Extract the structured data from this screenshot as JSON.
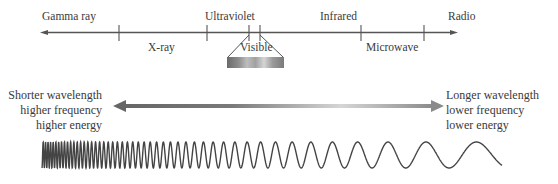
{
  "spectrum": {
    "bands_above": [
      {
        "label": "Gamma ray",
        "x": 42
      },
      {
        "label": "Ultraviolet",
        "x": 205
      },
      {
        "label": "Infrared",
        "x": 320
      },
      {
        "label": "Radio",
        "x": 448
      }
    ],
    "bands_below": [
      {
        "label": "X-ray",
        "x": 148
      },
      {
        "label": "Visible",
        "x": 240
      },
      {
        "label": "Microwave",
        "x": 368
      }
    ]
  },
  "left_note": {
    "line1": "Shorter wavelength",
    "line2": "higher frequency",
    "line3": "higher energy"
  },
  "right_note": {
    "line1": "Longer wavelength",
    "line2": "lower frequency",
    "line3": "lower energy"
  },
  "colors": {
    "line": "#555555",
    "text": "#3a3a3a",
    "arrow_dark": "#5a5a5a",
    "arrow_light": "#d8d8d8"
  }
}
